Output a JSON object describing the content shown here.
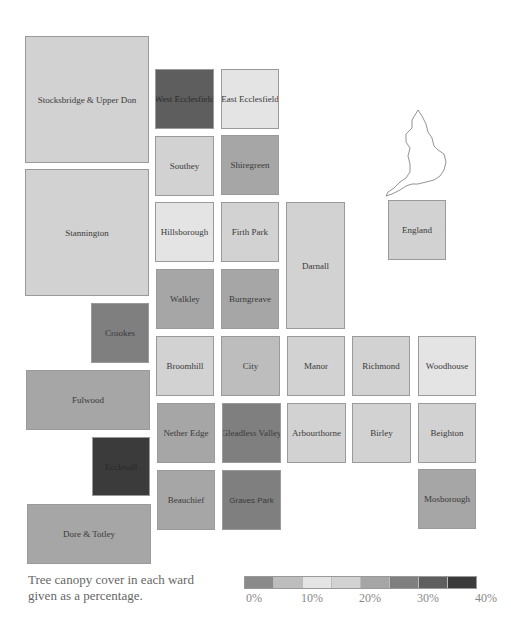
{
  "chart_data": {
    "type": "heatmap",
    "title": "Tree canopy cover in each ward given as a percentage.",
    "xlabel": "",
    "ylabel": "",
    "value_unit": "%",
    "color_scale": {
      "range": [
        0,
        40
      ],
      "bins": [
        {
          "from": 0,
          "to": 5,
          "color": "#8a8a8a"
        },
        {
          "from": 5,
          "to": 10,
          "color": "#bdbdbd"
        },
        {
          "from": 10,
          "to": 15,
          "color": "#e4e4e4"
        },
        {
          "from": 15,
          "to": 20,
          "color": "#d2d2d2"
        },
        {
          "from": 20,
          "to": 25,
          "color": "#a6a6a6"
        },
        {
          "from": 25,
          "to": 30,
          "color": "#7f7f7f"
        },
        {
          "from": 30,
          "to": 35,
          "color": "#5e5e5e"
        },
        {
          "from": 35,
          "to": 40,
          "color": "#3b3b3b"
        }
      ],
      "tick_labels": [
        "0%",
        "10%",
        "20%",
        "30%",
        "40%"
      ]
    },
    "wards": [
      {
        "name": "Stocksbridge & Upper Don",
        "value": 17,
        "color": "#d2d2d2",
        "x": 25,
        "y": 36,
        "w": 124,
        "h": 127
      },
      {
        "name": "West Ecclesfield",
        "value": 32,
        "color": "#5e5e5e",
        "x": 155,
        "y": 69,
        "w": 59,
        "h": 60
      },
      {
        "name": "East Ecclesfield",
        "value": 12,
        "color": "#e4e4e4",
        "x": 221,
        "y": 69,
        "w": 58,
        "h": 60
      },
      {
        "name": "Southey",
        "value": 17,
        "color": "#d2d2d2",
        "x": 155,
        "y": 136,
        "w": 59,
        "h": 60
      },
      {
        "name": "Shiregreen",
        "value": 23,
        "color": "#a6a6a6",
        "x": 221,
        "y": 135,
        "w": 58,
        "h": 60
      },
      {
        "name": "Stannington",
        "value": 17,
        "color": "#d2d2d2",
        "x": 25,
        "y": 169,
        "w": 124,
        "h": 127
      },
      {
        "name": "Hillsborough",
        "value": 12,
        "color": "#e4e4e4",
        "x": 155,
        "y": 202,
        "w": 59,
        "h": 60
      },
      {
        "name": "Firth Park",
        "value": 17,
        "color": "#d2d2d2",
        "x": 221,
        "y": 202,
        "w": 58,
        "h": 60
      },
      {
        "name": "Darnall",
        "value": 17,
        "color": "#d2d2d2",
        "x": 286,
        "y": 202,
        "w": 59,
        "h": 127
      },
      {
        "name": "England",
        "value": 17,
        "color": "#d2d2d2",
        "x": 388,
        "y": 200,
        "w": 58,
        "h": 60
      },
      {
        "name": "Walkley",
        "value": 23,
        "color": "#a6a6a6",
        "x": 156,
        "y": 269,
        "w": 58,
        "h": 60
      },
      {
        "name": "Burngreave",
        "value": 23,
        "color": "#a6a6a6",
        "x": 221,
        "y": 269,
        "w": 58,
        "h": 60
      },
      {
        "name": "Crookes",
        "value": 27,
        "color": "#7f7f7f",
        "x": 91,
        "y": 303,
        "w": 58,
        "h": 60
      },
      {
        "name": "Broomhill",
        "value": 17,
        "color": "#d2d2d2",
        "x": 156,
        "y": 336,
        "w": 58,
        "h": 60
      },
      {
        "name": "City",
        "value": 7,
        "color": "#bdbdbd",
        "x": 221,
        "y": 336,
        "w": 59,
        "h": 60
      },
      {
        "name": "Manor",
        "value": 17,
        "color": "#d2d2d2",
        "x": 287,
        "y": 336,
        "w": 58,
        "h": 60
      },
      {
        "name": "Richmond",
        "value": 17,
        "color": "#d2d2d2",
        "x": 352,
        "y": 336,
        "w": 58,
        "h": 60
      },
      {
        "name": "Woodhouse",
        "value": 12,
        "color": "#e4e4e4",
        "x": 418,
        "y": 336,
        "w": 58,
        "h": 60
      },
      {
        "name": "Fulwood",
        "value": 23,
        "color": "#a6a6a6",
        "x": 26,
        "y": 370,
        "w": 124,
        "h": 60
      },
      {
        "name": "Nether Edge",
        "value": 23,
        "color": "#a6a6a6",
        "x": 157,
        "y": 403,
        "w": 58,
        "h": 60
      },
      {
        "name": "Gleadless Valley",
        "value": 27,
        "color": "#7f7f7f",
        "x": 222,
        "y": 403,
        "w": 59,
        "h": 60
      },
      {
        "name": "Arbourthorne",
        "value": 17,
        "color": "#d2d2d2",
        "x": 287,
        "y": 403,
        "w": 59,
        "h": 60
      },
      {
        "name": "Birley",
        "value": 17,
        "color": "#d2d2d2",
        "x": 352,
        "y": 403,
        "w": 59,
        "h": 60
      },
      {
        "name": "Beighton",
        "value": 17,
        "color": "#d2d2d2",
        "x": 418,
        "y": 403,
        "w": 58,
        "h": 60
      },
      {
        "name": "Ecclesall",
        "value": 37,
        "color": "#3b3b3b",
        "x": 92,
        "y": 437,
        "w": 58,
        "h": 59
      },
      {
        "name": "Beauchief",
        "value": 23,
        "color": "#a6a6a6",
        "x": 157,
        "y": 470,
        "w": 58,
        "h": 60
      },
      {
        "name": "Graves Park",
        "value": 27,
        "color": "#7f7f7f",
        "x": 222,
        "y": 470,
        "w": 59,
        "h": 60
      },
      {
        "name": "Mosborough",
        "value": 23,
        "color": "#a6a6a6",
        "x": 418,
        "y": 469,
        "w": 58,
        "h": 60
      },
      {
        "name": "Dore & Totley",
        "value": 23,
        "color": "#a6a6a6",
        "x": 27,
        "y": 504,
        "w": 124,
        "h": 60
      }
    ]
  },
  "caption": {
    "line1": "Tree canopy cover in each ward",
    "line2": "given as a percentage."
  },
  "legend": {
    "colors": [
      "#8a8a8a",
      "#bdbdbd",
      "#e4e4e4",
      "#d2d2d2",
      "#a6a6a6",
      "#7f7f7f",
      "#5e5e5e",
      "#3b3b3b"
    ],
    "ticks": [
      "0%",
      "10%",
      "20%",
      "30%",
      "40%"
    ]
  },
  "inset": {
    "label": "england-outline-map"
  }
}
